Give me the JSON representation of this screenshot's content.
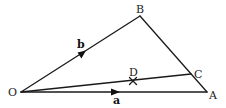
{
  "diagram": {
    "type": "vector-geometry-triangle",
    "points": {
      "O": {
        "label": "O",
        "x": 21,
        "y": 92
      },
      "A": {
        "label": "A",
        "x": 207,
        "y": 92
      },
      "B": {
        "label": "B",
        "x": 140,
        "y": 16
      },
      "C": {
        "label": "C",
        "x": 191,
        "y": 74
      },
      "D": {
        "label": "D",
        "x": 133,
        "y": 82
      }
    },
    "segments": [
      {
        "from": "O",
        "to": "A"
      },
      {
        "from": "O",
        "to": "B"
      },
      {
        "from": "B",
        "to": "A"
      },
      {
        "from": "O",
        "to": "C"
      }
    ],
    "vectors": {
      "a": {
        "label": "a",
        "along": "OA"
      },
      "b": {
        "label": "b",
        "along": "OB"
      }
    },
    "marks": {
      "D": {
        "type": "cross",
        "on": "OC"
      }
    },
    "colors": {
      "line": "#1a1a1a",
      "text": "#222222"
    }
  }
}
